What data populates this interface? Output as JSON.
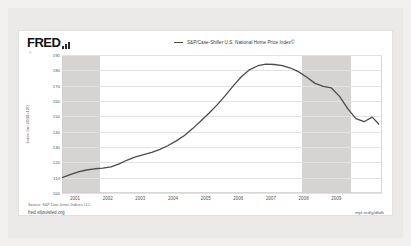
{
  "branding": {
    "logo_text": "FRED",
    "logo_icon": "bar-chart-icon",
    "registered_mark": "®"
  },
  "legend": {
    "items": [
      {
        "label": "S&P/Case-Shiller U.S. National Home Price Index©",
        "color": "#4b4b4b"
      }
    ]
  },
  "footer": {
    "source": "Source: S&P Dow Jones Indices LLC",
    "site_url": "fred.stlouisfed.org",
    "short_url": "myf.red/g/dkdk"
  },
  "colors": {
    "page_background": "#f2f0ee",
    "panel_background": "#eceae8",
    "card_background": "#ffffff",
    "series_line": "#4b4b4b",
    "recession_band": "#cfcdcb",
    "gridline": "#e4e2e0"
  },
  "chart_data": {
    "type": "line",
    "title": "",
    "xlabel": "",
    "ylabel": "Index Jan 2000=100",
    "ylim": [
      100,
      190
    ],
    "xlim": [
      2000.6,
      2010.4
    ],
    "grid": true,
    "legend_position": "top-center",
    "yticks": [
      100,
      110,
      120,
      130,
      140,
      150,
      160,
      170,
      180,
      190
    ],
    "xticks": [
      2001,
      2002,
      2003,
      2004,
      2005,
      2006,
      2007,
      2008,
      2009
    ],
    "recession_bands": [
      {
        "start": 2000.6,
        "end": 2001.75
      },
      {
        "start": 2007.95,
        "end": 2009.45
      }
    ],
    "series": [
      {
        "name": "S&P/Case-Shiller U.S. National Home Price Index©",
        "color": "#4b4b4b",
        "x": [
          2000.6,
          2000.85,
          2001.1,
          2001.35,
          2001.6,
          2001.85,
          2002.1,
          2002.35,
          2002.6,
          2002.85,
          2003.1,
          2003.35,
          2003.6,
          2003.85,
          2004.1,
          2004.35,
          2004.6,
          2004.85,
          2005.1,
          2005.35,
          2005.6,
          2005.85,
          2006.1,
          2006.35,
          2006.6,
          2006.85,
          2007.1,
          2007.35,
          2007.6,
          2007.85,
          2008.1,
          2008.35,
          2008.6,
          2008.85,
          2009.1,
          2009.35,
          2009.6,
          2009.85,
          2010.1,
          2010.3
        ],
        "y": [
          110.0,
          112.0,
          113.8,
          115.0,
          115.8,
          116.2,
          117.0,
          119.0,
          121.5,
          123.5,
          125.0,
          126.5,
          128.5,
          131.0,
          134.0,
          137.5,
          142.0,
          147.0,
          152.0,
          157.5,
          163.5,
          170.0,
          176.0,
          180.5,
          183.0,
          184.0,
          183.8,
          183.0,
          181.5,
          179.0,
          175.5,
          171.5,
          169.5,
          168.5,
          163.0,
          155.0,
          148.5,
          146.5,
          149.5,
          145.0
        ]
      }
    ]
  }
}
